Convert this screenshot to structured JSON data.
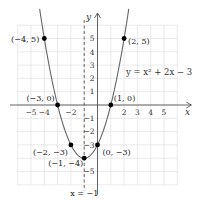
{
  "chart_data": {
    "type": "line",
    "title": "",
    "function": "y = x^2 + 2x - 3",
    "equation_label": "y = x² + 2x − 3",
    "xlabel": "x",
    "ylabel": "y",
    "xlim": [
      -6,
      6
    ],
    "ylim": [
      -6,
      6
    ],
    "grid": true,
    "x_ticks": [
      {
        "value": -5,
        "label": "−5"
      },
      {
        "value": -4,
        "label": "−4"
      },
      {
        "value": -2,
        "label": "−2"
      },
      {
        "value": 2,
        "label": "2"
      },
      {
        "value": 3,
        "label": "3"
      },
      {
        "value": 4,
        "label": "4"
      },
      {
        "value": 5,
        "label": "5"
      }
    ],
    "y_ticks": [
      {
        "value": 5,
        "label": "5"
      },
      {
        "value": 4,
        "label": "4"
      },
      {
        "value": 3,
        "label": "3"
      },
      {
        "value": 2,
        "label": "2"
      },
      {
        "value": 1,
        "label": "1"
      },
      {
        "value": -1,
        "label": "−1"
      },
      {
        "value": -2,
        "label": "−2"
      },
      {
        "value": -3,
        "label": "−3"
      },
      {
        "value": -5,
        "label": "−5"
      }
    ],
    "points": [
      {
        "x": -4,
        "y": 5,
        "label": "(−4, 5)",
        "anchor": "left"
      },
      {
        "x": 2,
        "y": 5,
        "label": "(2, 5)",
        "anchor": "right"
      },
      {
        "x": -3,
        "y": 0,
        "label": "(−3, 0)",
        "anchor": "above-left"
      },
      {
        "x": 1,
        "y": 0,
        "label": "(1, 0)",
        "anchor": "above-right"
      },
      {
        "x": -2,
        "y": -3,
        "label": "(−2, −3)",
        "anchor": "below-left"
      },
      {
        "x": 0,
        "y": -3,
        "label": "(0, −3)",
        "anchor": "below-right"
      },
      {
        "x": -1,
        "y": -4,
        "label": "(−1, −4)",
        "anchor": "below-left"
      }
    ],
    "axis_of_symmetry": {
      "x": -1,
      "label": "x = −1"
    },
    "curve_x_range": [
      -4.35,
      2.35
    ]
  }
}
